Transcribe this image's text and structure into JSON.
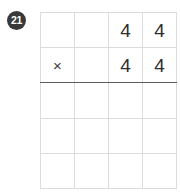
{
  "problem": {
    "number_label": "21",
    "operation": "multiplication",
    "operator_symbol": "×",
    "multiplicand": "44",
    "multiplier": "44",
    "answer_rows_blank": 3
  },
  "colors": {
    "page_background": "#ffffff",
    "grid_line": "#dcdcdc",
    "answer_rule": "#5c5c5c",
    "digit": "#2e2e2e",
    "badge_fill": "#3a3a3a",
    "badge_text": "#ffffff"
  },
  "grid": {
    "columns": 4,
    "rows": 5,
    "cells": [
      [
        {
          "name": "r1c1",
          "value": ""
        },
        {
          "name": "r1c2",
          "value": ""
        },
        {
          "name": "r1c3",
          "value": "4"
        },
        {
          "name": "r1c4",
          "value": "4"
        }
      ],
      [
        {
          "name": "r2c1",
          "value": "×"
        },
        {
          "name": "r2c2",
          "value": ""
        },
        {
          "name": "r2c3",
          "value": "4"
        },
        {
          "name": "r2c4",
          "value": "4"
        }
      ],
      [
        {
          "name": "r3c1",
          "value": ""
        },
        {
          "name": "r3c2",
          "value": ""
        },
        {
          "name": "r3c3",
          "value": ""
        },
        {
          "name": "r3c4",
          "value": ""
        }
      ],
      [
        {
          "name": "r4c1",
          "value": ""
        },
        {
          "name": "r4c2",
          "value": ""
        },
        {
          "name": "r4c3",
          "value": ""
        },
        {
          "name": "r4c4",
          "value": ""
        }
      ],
      [
        {
          "name": "r5c1",
          "value": ""
        },
        {
          "name": "r5c2",
          "value": ""
        },
        {
          "name": "r5c3",
          "value": ""
        },
        {
          "name": "r5c4",
          "value": ""
        }
      ]
    ]
  }
}
